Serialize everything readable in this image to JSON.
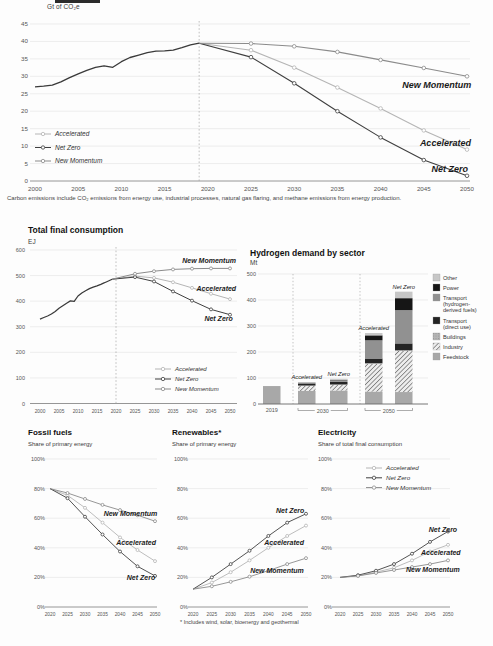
{
  "colors": {
    "accelerated": "#b5b5b5",
    "net_zero": "#3f3f3f",
    "new_momentum": "#8b8b8b",
    "historical": "#3a3a3a",
    "grid": "#e2e2e2",
    "axis_strong": "#8a8a8a",
    "tick_text": "#555555",
    "annotation_text": "#1a1a1a",
    "sector_fills": {
      "other": "#c7c7c7",
      "power": "#161616",
      "transport_derived": "#919191",
      "transport_direct": "#242424",
      "buildings": "#b5b5b5",
      "industry_line": "#767676",
      "industry_bg": "#ededed",
      "feedstock": "#a8a8a8"
    }
  },
  "header": {
    "unit_label": "Gt of CO₂e",
    "cropped_fragment": "true"
  },
  "footnotes": {
    "carbon": "Carbon emissions include CO₂ emissions from energy use, industrial processes, natural gas flaring, and methane emissions from energy production.",
    "renewables": "* Includes wind, solar, bioenergy and geothermal"
  },
  "sections": {
    "tfc": {
      "title": "Total final consumption",
      "unit": "EJ"
    },
    "hydrogen": {
      "title": "Hydrogen demand by sector",
      "unit": "Mt"
    },
    "fossil": {
      "title": "Fossil fuels",
      "subtitle": "Share of primary energy"
    },
    "renewables": {
      "title": "Renewables*",
      "subtitle": "Share of primary energy"
    },
    "electricity": {
      "title": "Electricity",
      "subtitle": "Share of total final consumption"
    }
  },
  "scenarios": [
    "Accelerated",
    "Net Zero",
    "New Momentum"
  ],
  "chart_data": [
    {
      "id": "carbon",
      "type": "line",
      "title": "Carbon emissions",
      "ylabel": "Gt of CO₂e",
      "xlim": [
        2000,
        2050
      ],
      "ylim": [
        0,
        45
      ],
      "xticks": [
        2000,
        2005,
        2010,
        2015,
        2020,
        2025,
        2030,
        2035,
        2040,
        2045,
        2050
      ],
      "yticks": [
        0,
        5,
        10,
        15,
        20,
        25,
        30,
        35,
        40,
        45
      ],
      "ytick_suffix": "",
      "divider_x": 2019,
      "history": {
        "name": "History",
        "x": [
          2000,
          2001,
          2002,
          2003,
          2004,
          2005,
          2006,
          2007,
          2008,
          2009,
          2010,
          2011,
          2012,
          2013,
          2014,
          2015,
          2016,
          2017,
          2018,
          2019
        ],
        "y": [
          27.0,
          27.2,
          27.5,
          28.4,
          29.6,
          30.7,
          31.7,
          32.6,
          33.0,
          32.6,
          34.2,
          35.4,
          36.1,
          36.8,
          37.2,
          37.3,
          37.5,
          38.2,
          39.0,
          39.5
        ]
      },
      "series": [
        {
          "name": "Accelerated",
          "x": [
            2019,
            2025,
            2030,
            2035,
            2040,
            2045,
            2050
          ],
          "y": [
            39.5,
            37.5,
            32.5,
            26.8,
            20.8,
            14.5,
            9
          ]
        },
        {
          "name": "Net Zero",
          "x": [
            2019,
            2025,
            2030,
            2035,
            2040,
            2045,
            2050
          ],
          "y": [
            39.5,
            35.5,
            28,
            20,
            12.5,
            6,
            1.5
          ]
        },
        {
          "name": "New Momentum",
          "x": [
            2019,
            2025,
            2030,
            2035,
            2040,
            2045,
            2050
          ],
          "y": [
            39.5,
            39.4,
            38.6,
            37,
            34.7,
            32.4,
            30
          ]
        }
      ],
      "annotations": [
        {
          "text": "New Momentum",
          "x": 2046.5,
          "y": 27.3
        },
        {
          "text": "Accelerated",
          "x": 2047.5,
          "y": 10.6
        },
        {
          "text": "Net Zero",
          "x": 2048.0,
          "y": 3.2
        }
      ],
      "legend": {
        "items": [
          "Accelerated",
          "Net Zero",
          "New Momentum"
        ],
        "position": "in-plot-left"
      }
    },
    {
      "id": "tfc",
      "type": "line",
      "title": "Total final consumption",
      "ylabel": "EJ",
      "xlim": [
        2000,
        2050
      ],
      "ylim": [
        0,
        600
      ],
      "xticks": [
        2000,
        2005,
        2010,
        2015,
        2020,
        2025,
        2030,
        2035,
        2040,
        2045,
        2050
      ],
      "yticks": [
        0,
        100,
        200,
        300,
        400,
        500,
        600
      ],
      "ytick_suffix": "",
      "divider_x": 2020,
      "history": {
        "name": "History",
        "x": [
          2000,
          2001,
          2002,
          2003,
          2004,
          2005,
          2006,
          2007,
          2008,
          2009,
          2010,
          2011,
          2012,
          2013,
          2014,
          2015,
          2016,
          2017,
          2018,
          2019
        ],
        "y": [
          330,
          336,
          342,
          350,
          360,
          372,
          382,
          392,
          401,
          399,
          420,
          432,
          441,
          449,
          455,
          460,
          466,
          472,
          479,
          486
        ]
      },
      "series": [
        {
          "name": "Accelerated",
          "x": [
            2019,
            2025,
            2030,
            2035,
            2040,
            2045,
            2050
          ],
          "y": [
            486,
            498,
            491,
            474,
            452,
            429,
            408
          ]
        },
        {
          "name": "Net Zero",
          "x": [
            2019,
            2025,
            2030,
            2035,
            2040,
            2045,
            2050
          ],
          "y": [
            486,
            494,
            477,
            438,
            402,
            368,
            347
          ]
        },
        {
          "name": "New Momentum",
          "x": [
            2019,
            2025,
            2030,
            2035,
            2040,
            2045,
            2050
          ],
          "y": [
            486,
            507,
            517,
            524,
            527,
            528,
            528
          ]
        }
      ],
      "annotations": [
        {
          "text": "New Momentum",
          "x": 2044.5,
          "y": 557
        },
        {
          "text": "Accelerated",
          "x": 2046.4,
          "y": 449
        },
        {
          "text": "Net Zero",
          "x": 2047.0,
          "y": 331
        }
      ],
      "legend": {
        "items": [
          "Accelerated",
          "Net Zero",
          "New Momentum"
        ],
        "position": "in-plot-bottom-right"
      }
    },
    {
      "id": "hydrogen",
      "type": "stacked-bar",
      "title": "Hydrogen demand by sector",
      "ylabel": "Mt",
      "ylim": [
        0,
        500
      ],
      "yticks": [
        0,
        100,
        200,
        300,
        400,
        500
      ],
      "sectors_bottom_to_top": [
        "Feedstock",
        "Industry",
        "Buildings",
        "Transport (direct use)",
        "Transport (hydrogen-derived fuels)",
        "Power",
        "Other"
      ],
      "sector_fill_keys": [
        "feedstock",
        "industry",
        "buildings",
        "transport_direct",
        "transport_derived",
        "power",
        "other"
      ],
      "groups": [
        {
          "label": "2019",
          "bars": [
            {
              "name": "",
              "values": [
                69,
                0,
                0,
                0,
                0,
                0,
                0
              ],
              "total": 69
            }
          ]
        },
        {
          "label": "2030",
          "bars": [
            {
              "name": "Accelerated",
              "values": [
                50,
                20,
                1,
                8,
                2,
                1,
                1
              ],
              "total": 83
            },
            {
              "name": "Net Zero",
              "values": [
                52,
                22,
                1,
                10,
                6,
                2,
                4
              ],
              "total": 97
            }
          ]
        },
        {
          "label": "2050",
          "bars": [
            {
              "name": "Accelerated",
              "values": [
                48,
                106,
                3,
                18,
                70,
                19,
                9
              ],
              "total": 273
            },
            {
              "name": "Net Zero",
              "values": [
                46,
                158,
                3,
                26,
                128,
                46,
                25
              ],
              "total": 432
            }
          ]
        }
      ],
      "legend_top_to_bottom": [
        {
          "name": "Other",
          "lines": [
            "Other"
          ],
          "fill": "other"
        },
        {
          "name": "Power",
          "lines": [
            "Power"
          ],
          "fill": "power"
        },
        {
          "name": "Transport (hydrogen-derived fuels)",
          "lines": [
            "Transport",
            "(hydrogen-",
            "derived fuels)"
          ],
          "fill": "transport_derived"
        },
        {
          "name": "Transport (direct use)",
          "lines": [
            "Transport",
            "(direct use)"
          ],
          "fill": "transport_direct"
        },
        {
          "name": "Buildings",
          "lines": [
            "Buildings"
          ],
          "fill": "buildings"
        },
        {
          "name": "Industry",
          "lines": [
            "Industry"
          ],
          "fill": "industry"
        },
        {
          "name": "Feedstock",
          "lines": [
            "Feedstock"
          ],
          "fill": "feedstock"
        }
      ]
    },
    {
      "id": "fossil",
      "type": "line",
      "title": "Fossil fuels",
      "ylabel": "Share of primary energy",
      "xlim": [
        2020,
        2050
      ],
      "ylim": [
        0,
        100
      ],
      "xticks": [
        2020,
        2025,
        2030,
        2035,
        2040,
        2045,
        2050
      ],
      "yticks": [
        0,
        20,
        40,
        60,
        80,
        100
      ],
      "ytick_suffix": "%",
      "divider_x": null,
      "history": null,
      "series": [
        {
          "name": "Accelerated",
          "x": [
            2020,
            2025,
            2030,
            2035,
            2040,
            2045,
            2050
          ],
          "y": [
            80,
            75.5,
            67,
            57,
            47,
            38.5,
            31
          ]
        },
        {
          "name": "Net Zero",
          "x": [
            2020,
            2025,
            2030,
            2035,
            2040,
            2045,
            2050
          ],
          "y": [
            80,
            73.5,
            61,
            49,
            37.5,
            27.5,
            21
          ]
        },
        {
          "name": "New Momentum",
          "x": [
            2020,
            2025,
            2030,
            2035,
            2040,
            2045,
            2050
          ],
          "y": [
            80,
            77,
            73,
            69,
            65.5,
            62,
            58
          ]
        }
      ],
      "annotations": [
        {
          "text": "New Momentum",
          "x": 2043.0,
          "y": 63
        },
        {
          "text": "Accelerated",
          "x": 2044.6,
          "y": 43
        },
        {
          "text": "Net Zero",
          "x": 2046.0,
          "y": 19.5
        }
      ],
      "legend": null
    },
    {
      "id": "renewables",
      "type": "line",
      "title": "Renewables*",
      "ylabel": "Share of primary energy",
      "xlim": [
        2020,
        2050
      ],
      "ylim": [
        0,
        100
      ],
      "xticks": [
        2020,
        2025,
        2030,
        2035,
        2040,
        2045,
        2050
      ],
      "yticks": [
        0,
        20,
        40,
        60,
        80,
        100
      ],
      "ytick_suffix": "%",
      "divider_x": null,
      "history": null,
      "series": [
        {
          "name": "Accelerated",
          "x": [
            2020,
            2025,
            2030,
            2035,
            2040,
            2045,
            2050
          ],
          "y": [
            12,
            16.5,
            23.5,
            31.5,
            40,
            48,
            55
          ]
        },
        {
          "name": "Net Zero",
          "x": [
            2020,
            2025,
            2030,
            2035,
            2040,
            2045,
            2050
          ],
          "y": [
            12,
            20,
            29,
            38,
            48,
            57,
            63
          ]
        },
        {
          "name": "New Momentum",
          "x": [
            2020,
            2025,
            2030,
            2035,
            2040,
            2045,
            2050
          ],
          "y": [
            12,
            14,
            17,
            20.5,
            24.5,
            29,
            33
          ]
        }
      ],
      "annotations": [
        {
          "text": "Net Zero",
          "x": 2045.8,
          "y": 65
        },
        {
          "text": "Accelerated",
          "x": 2044.2,
          "y": 43
        },
        {
          "text": "New Momentum",
          "x": 2042.3,
          "y": 24.5
        }
      ],
      "legend": null
    },
    {
      "id": "electricity",
      "type": "line",
      "title": "Electricity",
      "ylabel": "Share of total final consumption",
      "xlim": [
        2020,
        2050
      ],
      "ylim": [
        0,
        100
      ],
      "xticks": [
        2020,
        2025,
        2030,
        2035,
        2040,
        2045,
        2050
      ],
      "yticks": [
        0,
        20,
        40,
        60,
        80,
        100
      ],
      "ytick_suffix": "%",
      "divider_x": null,
      "history": null,
      "series": [
        {
          "name": "Accelerated",
          "x": [
            2020,
            2025,
            2030,
            2035,
            2040,
            2045,
            2050
          ],
          "y": [
            20,
            21,
            23.5,
            26.5,
            31.5,
            37.5,
            42
          ]
        },
        {
          "name": "Net Zero",
          "x": [
            2020,
            2025,
            2030,
            2035,
            2040,
            2045,
            2050
          ],
          "y": [
            20,
            21.5,
            24.5,
            29,
            36,
            44,
            51
          ]
        },
        {
          "name": "New Momentum",
          "x": [
            2020,
            2025,
            2030,
            2035,
            2040,
            2045,
            2050
          ],
          "y": [
            20,
            21,
            23,
            25,
            27,
            29,
            31.5
          ]
        }
      ],
      "annotations": [
        {
          "text": "Net Zero",
          "x": 2048.6,
          "y": 52
        },
        {
          "text": "Accelerated",
          "x": 2048.0,
          "y": 36.8
        },
        {
          "text": "New Momentum",
          "x": 2045.8,
          "y": 25
        }
      ],
      "legend": {
        "items": [
          "Accelerated",
          "Net Zero",
          "New Momentum"
        ],
        "position": "in-plot-top"
      }
    }
  ]
}
